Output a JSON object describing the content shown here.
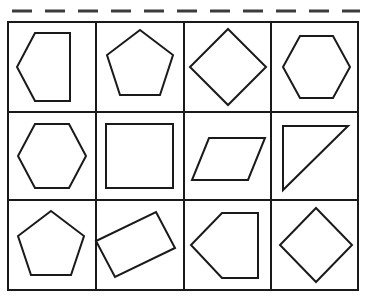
{
  "page": {
    "background_color": "#ffffff",
    "width": 367,
    "height": 299
  },
  "cut_line": {
    "name": "dashed-cut-line",
    "color": "#3b3b3b",
    "y": 11,
    "dash_length": 20,
    "gap_length": 13,
    "start_x": 12,
    "end_x": 360,
    "stroke_width": 3
  },
  "grid": {
    "stroke_color": "#1a1a1a",
    "stroke_width": 2,
    "x": 8,
    "y": 22,
    "width": 350,
    "height": 268,
    "columns": 4,
    "rows": 3,
    "column_edges": [
      8,
      96,
      184,
      271,
      358
    ],
    "row_edges": [
      22,
      112,
      200,
      290
    ]
  },
  "cells": [
    {
      "index": 1,
      "row": 1,
      "column": 1,
      "shape_name": "pentagon-pointing-left",
      "shape_type": "pentagon",
      "points": "70,33 70,101 35,101 17,67 35,33"
    },
    {
      "index": 2,
      "row": 1,
      "column": 2,
      "shape_name": "regular-pentagon",
      "shape_type": "pentagon",
      "points": "140,30 173,55 160,95 120,95 107,55"
    },
    {
      "index": 3,
      "row": 1,
      "column": 3,
      "shape_name": "diamond-square-rotated",
      "shape_type": "square",
      "points": "228,29 266,67 228,105 190,67"
    },
    {
      "index": 4,
      "row": 1,
      "column": 4,
      "shape_name": "hexagon-flat-top",
      "shape_type": "hexagon",
      "points": "300,36 333,36 350,67 333,98 300,98 283,67"
    },
    {
      "index": 5,
      "row": 2,
      "column": 1,
      "shape_name": "hexagon-flat-top",
      "shape_type": "hexagon",
      "points": "35,124 69,124 86,156 69,188 35,188 18,156"
    },
    {
      "index": 6,
      "row": 2,
      "column": 2,
      "shape_name": "square",
      "shape_type": "square",
      "points": "106,124 173,124 173,188 106,188"
    },
    {
      "index": 7,
      "row": 2,
      "column": 3,
      "shape_name": "parallelogram",
      "shape_type": "parallelogram",
      "points": "209,138 265,138 248,180 192,180"
    },
    {
      "index": 8,
      "row": 2,
      "column": 4,
      "shape_name": "right-triangle",
      "shape_type": "triangle",
      "points": "283,126 348,126 283,190"
    },
    {
      "index": 9,
      "row": 3,
      "column": 1,
      "shape_name": "regular-pentagon",
      "shape_type": "pentagon",
      "points": "51,211 84,236 71,275 31,275 18,236"
    },
    {
      "index": 10,
      "row": 3,
      "column": 2,
      "shape_name": "rectangle-rotated",
      "shape_type": "rectangle",
      "points": "156,212 175,248 115,277 96,241"
    },
    {
      "index": 11,
      "row": 3,
      "column": 3,
      "shape_name": "pentagon-pointing-left",
      "shape_type": "pentagon",
      "points": "258,213 258,278 222,278 191,245 222,213"
    },
    {
      "index": 12,
      "row": 3,
      "column": 4,
      "shape_name": "diamond-square-rotated",
      "shape_type": "square",
      "points": "316,208 352,245 316,282 280,245"
    }
  ]
}
